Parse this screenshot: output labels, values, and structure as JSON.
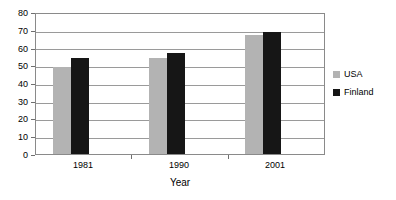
{
  "chart_data": {
    "type": "bar",
    "title": "",
    "subtitle": "",
    "xlabel": "Year",
    "ylabel": "",
    "categories": [
      "1981",
      "1990",
      "2001"
    ],
    "series": [
      {
        "name": "USA",
        "values": [
          49,
          54,
          67
        ],
        "color": "#b3b3b3"
      },
      {
        "name": "Finland",
        "values": [
          54,
          57,
          69
        ],
        "color": "#161616"
      }
    ],
    "ylim": [
      0,
      80
    ],
    "ytick_step": 10,
    "yticks": [
      0,
      10,
      20,
      30,
      40,
      50,
      60,
      70,
      80
    ],
    "ytick_labels": [
      "0",
      "10",
      "20",
      "30",
      "40",
      "50",
      "60",
      "70",
      "80"
    ],
    "grid": true,
    "grid_axis": "y",
    "legend_position": "right",
    "plot_border": true,
    "annotations": []
  },
  "legend": {
    "entries": [
      {
        "label": "USA",
        "swatch": "usa-swatch"
      },
      {
        "label": "Finland",
        "swatch": "finland-swatch"
      }
    ]
  },
  "axes": {
    "x_title": "Year"
  }
}
